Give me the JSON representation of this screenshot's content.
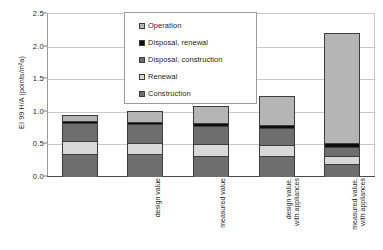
{
  "chart_data": {
    "type": "bar",
    "subtype": "stacked-bar",
    "title": "",
    "xlabel": "",
    "ylabel": "EI 99 H/A (points/m²a)",
    "ylim": [
      0.0,
      2.5
    ],
    "ytick_labels": [
      "0.0",
      "0.5",
      "1.0",
      "1.5",
      "2.0",
      "2.5"
    ],
    "ytick_values": [
      0.0,
      0.5,
      1.0,
      1.5,
      2.0,
      2.5
    ],
    "grid": true,
    "legend_position": "upper-center",
    "categories": [
      "design value",
      "measured value",
      "design value,\nwith appliances",
      "measured value,\nwith appliances",
      "Reference\n(without\nappliances)"
    ],
    "series": [
      {
        "name": "Construction",
        "color": "#6e6e6e",
        "values": [
          0.33,
          0.33,
          0.31,
          0.31,
          0.18
        ]
      },
      {
        "name": "Renewal",
        "color": "#d9d9d9",
        "values": [
          0.2,
          0.17,
          0.18,
          0.16,
          0.13
        ]
      },
      {
        "name": "Disposal, construction",
        "color": "#6e6e6e",
        "values": [
          0.28,
          0.29,
          0.28,
          0.27,
          0.13
        ]
      },
      {
        "name": "Disposal, renewal",
        "color": "#0d0d0d",
        "values": [
          0.03,
          0.04,
          0.04,
          0.04,
          0.06
        ]
      },
      {
        "name": "Operation",
        "color": "#b5b5b5",
        "values": [
          0.1,
          0.17,
          0.26,
          0.45,
          1.7
        ]
      }
    ],
    "totals": [
      0.94,
      1.0,
      1.07,
      1.23,
      2.2
    ]
  },
  "legend": {
    "items": [
      {
        "label": "Operation",
        "color": "#b5b5b5"
      },
      {
        "label": "Disposal, renewal",
        "color": "#0d0d0d"
      },
      {
        "label": "Disposal, construction",
        "color": "#6e6e6e"
      },
      {
        "label": "Renewal",
        "color": "#d9d9d9"
      },
      {
        "label": "Construction",
        "color": "#6e6e6e"
      }
    ]
  }
}
